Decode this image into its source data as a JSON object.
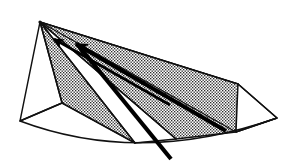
{
  "figure": {
    "caption": "(d) Late Afternoon",
    "panel_label": "(d)",
    "panel_title": "Late Afternoon",
    "kind": "line-drawing-diagram",
    "background_color": "#ffffff",
    "ink_color": "#111111",
    "shade_fill_color": "#8a8a8a",
    "shade_pattern": "fine-crosshatch-dots",
    "ray_color": "#000000",
    "geometry": {
      "apex": [
        40,
        22
      ],
      "left_base_corner": [
        20,
        121
      ],
      "left_eave": [
        62,
        103
      ],
      "shade_right_top": [
        238,
        84
      ],
      "right_far_corner": [
        277,
        118
      ],
      "right_lower_vertex": [
        236,
        132
      ],
      "baseline_curve": {
        "start": [
          20,
          121
        ],
        "control": [
          140,
          165
        ],
        "end": [
          277,
          118
        ]
      },
      "radial_edges": [
        [
          40,
          22,
          62,
          103
        ],
        [
          40,
          22,
          135,
          143
        ],
        [
          40,
          22,
          176,
          139
        ],
        [
          40,
          22,
          236,
          132
        ],
        [
          40,
          22,
          238,
          84
        ]
      ]
    },
    "shaded_wedges": [
      {
        "name": "wedge-left",
        "points": "40,22 62,103 135,143 238,84"
      },
      {
        "name": "wedge-right",
        "points": "40,22 176,139 236,132 238,84"
      }
    ],
    "white_wedges": [
      {
        "name": "white-wedge-left-face",
        "points": "40,22 20,121 62,103"
      },
      {
        "name": "white-wedge-middle",
        "points": "40,22 135,143 176,139"
      },
      {
        "name": "white-wedge-right-face",
        "points": "238,84 236,132 277,118"
      }
    ],
    "sun_rays": [
      {
        "name": "ray-upper",
        "from": [
          170,
          105
        ],
        "to": [
          52,
          38
        ],
        "has_arrowhead": true,
        "width": 2.6
      },
      {
        "name": "ray-main",
        "from": [
          226,
          131
        ],
        "to": [
          72,
          43
        ],
        "has_arrowhead": true,
        "width": 4.2
      },
      {
        "name": "ray-lower",
        "from": [
          171,
          159
        ],
        "to": [
          76,
          44
        ],
        "has_arrowhead": false,
        "width": 4.2
      }
    ],
    "arrowheads": [
      {
        "name": "arrowhead-upper",
        "at": [
          52,
          38
        ],
        "size": 5
      },
      {
        "name": "arrowhead-main",
        "at": [
          73,
          43
        ],
        "size": 7
      }
    ]
  }
}
